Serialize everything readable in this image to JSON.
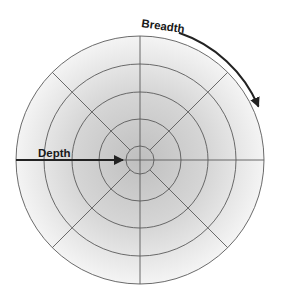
{
  "diagram": {
    "type": "concentric-polar-grid",
    "labels": {
      "depth": "Depth",
      "breadth": "Breadth"
    },
    "geometry": {
      "center": [
        140,
        160
      ],
      "ring_radii": [
        124,
        96,
        68,
        41,
        14
      ],
      "spoke_angles_deg": [
        0,
        45,
        90,
        135,
        180,
        225,
        270,
        315
      ]
    },
    "arrows": [
      {
        "name": "depth-arrow",
        "direction": "inward",
        "description": "radial arrow from outer edge toward center"
      },
      {
        "name": "breadth-arrow",
        "direction": "clockwise",
        "description": "curved arrow following outer circumference"
      }
    ],
    "colors": {
      "fill_center": "#c2c2c2",
      "fill_edge": "#f3f3f3",
      "grid_line": "#5a5a5a",
      "arrow": "#222222",
      "text": "#1a1a1a"
    }
  }
}
